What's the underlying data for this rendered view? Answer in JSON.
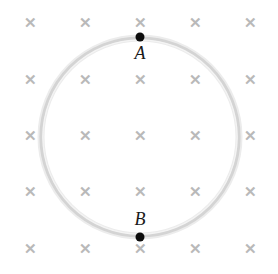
{
  "figure": {
    "name": "circular-loop-in-uniform-magnetic-field",
    "background_color": "#ffffff",
    "width": 278,
    "height": 274,
    "loop": {
      "icon": "circle-loop",
      "center_x": 140,
      "center_y": 137,
      "radius": 99,
      "stroke_color": "#d6d6d6",
      "stroke_color_light": "#e6e6e6",
      "stroke_width": 4
    },
    "field": {
      "icon": "x-mark",
      "symbol": "✕",
      "color": "#b9b9b9",
      "meaning": "magnetic field into page",
      "columns_x": [
        30,
        85,
        140,
        195,
        250
      ],
      "rows_y": [
        22,
        79,
        135,
        191,
        248
      ]
    },
    "nodes": [
      {
        "id": "A",
        "label": "A",
        "dot_color": "#0d0d0d",
        "dot_x": 140,
        "dot_y": 37,
        "label_x": 140,
        "label_y": 53
      },
      {
        "id": "B",
        "label": "B",
        "dot_color": "#0d0d0d",
        "dot_x": 140,
        "dot_y": 237,
        "label_x": 140,
        "label_y": 219
      }
    ]
  }
}
